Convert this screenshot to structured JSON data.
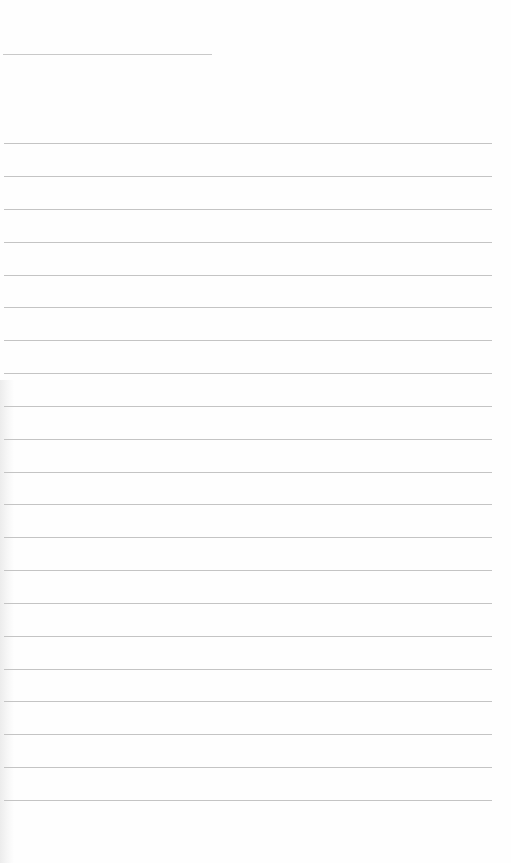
{
  "page": {
    "type": "blank lined notebook page",
    "background_color": "#fefefe",
    "line_color": "#c4c4c4"
  },
  "header_line": {
    "x1": 3,
    "x2": 212,
    "y": 54
  },
  "rules": {
    "x1": 4,
    "x2": 492,
    "count": 21,
    "y_positions": [
      143,
      176,
      209,
      242,
      275,
      307,
      340,
      373,
      406,
      439,
      472,
      504,
      537,
      570,
      603,
      636,
      669,
      701,
      734,
      767,
      800
    ]
  }
}
